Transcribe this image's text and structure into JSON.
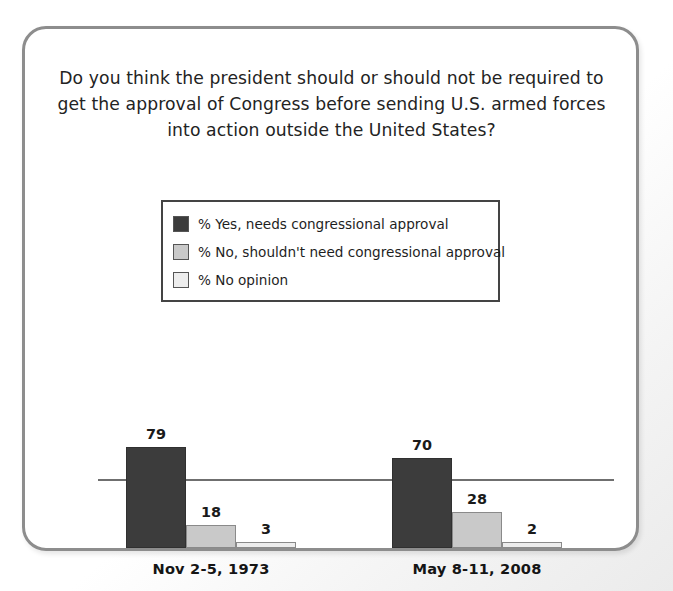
{
  "card": {
    "question": "Do you think the president should or should not be required to get the approval of Congress before sending U.S. armed forces into action outside the United States?"
  },
  "legend": {
    "items": [
      {
        "label": "% Yes, needs congressional approval",
        "color": "#3c3c3c"
      },
      {
        "label": "% No, shouldn't need congressional approval",
        "color": "#c9c9c9"
      },
      {
        "label": "% No opinion",
        "color": "#ededed"
      }
    ]
  },
  "chart_data": {
    "type": "bar",
    "title": "Do you think the president should or should not be required to get the approval of Congress before sending U.S. armed forces into action outside the United States?",
    "xlabel": "",
    "ylabel": "",
    "ylim": [
      0,
      100
    ],
    "grid": false,
    "legend_position": "top-center",
    "categories": [
      "Nov 2-5, 1973",
      "May 8-11, 2008"
    ],
    "series": [
      {
        "name": "% Yes, needs congressional approval",
        "color": "#3c3c3c",
        "values": [
          79,
          70
        ]
      },
      {
        "name": "% No, shouldn't need congressional approval",
        "color": "#c9c9c9",
        "values": [
          18,
          28
        ]
      },
      {
        "name": "% No opinion",
        "color": "#ededed",
        "values": [
          3,
          2
        ]
      }
    ]
  }
}
